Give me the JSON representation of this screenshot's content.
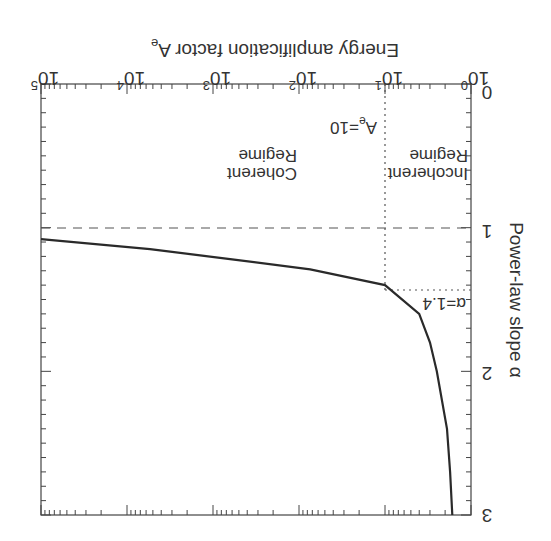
{
  "chart_data": {
    "type": "line",
    "orientation_note": "figure displayed rotated 180 degrees",
    "title": "",
    "xlabel": "Energy amplification factor  A_e",
    "ylabel": "Power-law slope α",
    "x_scale": "log",
    "xlim": [
      1,
      100000
    ],
    "ylim": [
      0,
      3
    ],
    "x_ticks": [
      {
        "base": "10",
        "exp": "0",
        "value": 1
      },
      {
        "base": "10",
        "exp": "1",
        "value": 10
      },
      {
        "base": "10",
        "exp": "2",
        "value": 100
      },
      {
        "base": "10",
        "exp": "3",
        "value": 1000
      },
      {
        "base": "10",
        "exp": "4",
        "value": 10000
      },
      {
        "base": "10",
        "exp": "5",
        "value": 100000
      }
    ],
    "y_ticks": [
      "0",
      "1",
      "2",
      "3"
    ],
    "series": [
      {
        "name": "A_e(alpha)",
        "style": "solid",
        "points": [
          {
            "alpha": 1.08,
            "A": 100000
          },
          {
            "alpha": 1.15,
            "A": 5400
          },
          {
            "alpha": 1.22,
            "A": 600
          },
          {
            "alpha": 1.29,
            "A": 74
          },
          {
            "alpha": 1.4,
            "A": 10
          },
          {
            "alpha": 1.6,
            "A": 4.0
          },
          {
            "alpha": 1.8,
            "A": 3.0
          },
          {
            "alpha": 2.0,
            "A": 2.5
          },
          {
            "alpha": 2.4,
            "A": 1.9
          },
          {
            "alpha": 2.7,
            "A": 1.75
          },
          {
            "alpha": 3.0,
            "A": 1.65
          }
        ]
      }
    ],
    "reference_lines": [
      {
        "type": "horizontal",
        "axis": "alpha",
        "value": 1.0,
        "style": "dashed"
      },
      {
        "type": "vertical",
        "axis": "A",
        "value": 10,
        "style": "dotted"
      },
      {
        "type": "horizontal",
        "axis": "alpha",
        "value": 1.4,
        "style": "dotted"
      }
    ],
    "annotations": [
      {
        "text": "A_e=10",
        "near": {
          "A": 10,
          "alpha": 0.3
        }
      },
      {
        "text": "α=1.4",
        "near": {
          "A": 2,
          "alpha": 1.4
        }
      },
      {
        "text": "Incoherent Regime",
        "near": {
          "A": 3,
          "alpha": 0.6
        }
      },
      {
        "text": "Coherent Regime",
        "near": {
          "A": 1000,
          "alpha": 0.6
        }
      }
    ],
    "grid": false,
    "legend": null
  },
  "labels": {
    "xlabel_main": "Energy amplification factor  A",
    "xlabel_sub": "e",
    "ylabel": "Power-law slope α",
    "ann_ae_main": "A",
    "ann_ae_sub": "e",
    "ann_ae_rest": "=10",
    "ann_alpha": "α=1.4",
    "incoherent_1": "Incoherent",
    "incoherent_2": "Regime",
    "coherent_1": "Coherent",
    "coherent_2": "Regime",
    "ytick_0": "0",
    "ytick_1": "1",
    "ytick_2": "2",
    "ytick_3": "3",
    "xtick_base": "10",
    "xtick_e0": "0",
    "xtick_e1": "1",
    "xtick_e2": "2",
    "xtick_e3": "3",
    "xtick_e4": "4",
    "xtick_e5": "5"
  }
}
